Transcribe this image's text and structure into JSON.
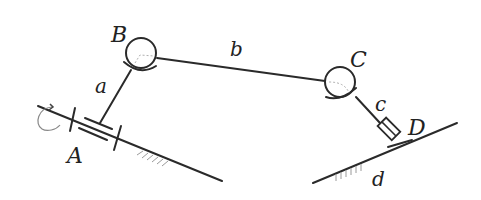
{
  "diagram": {
    "type": "four-bar linkage (spatial mechanism)",
    "labels": {
      "joint_A": "A",
      "joint_B": "B",
      "joint_C": "C",
      "joint_D": "D",
      "link_a": "a",
      "link_b": "b",
      "link_c": "c",
      "link_d": "d"
    },
    "elements": {
      "A": "revolute pair (bearing) on ground with rotation arrow",
      "B": "spherical pair",
      "C": "spherical pair",
      "D": "prismatic pair (slider) on ground"
    },
    "colors": {
      "ink": "#2a2a2a",
      "hatch": "#9a9a9a",
      "background": "#ffffff"
    }
  }
}
